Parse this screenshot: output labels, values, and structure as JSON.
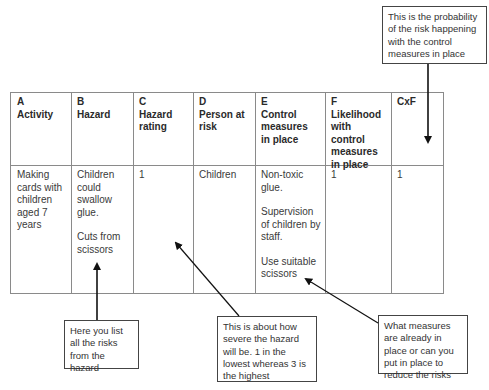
{
  "table": {
    "headers": [
      {
        "letter": "A",
        "label": "Activity"
      },
      {
        "letter": "B",
        "label": "Hazard"
      },
      {
        "letter": "C",
        "label": "Hazard rating"
      },
      {
        "letter": "D",
        "label": "Person at risk"
      },
      {
        "letter": "E",
        "label": "Control measures in place"
      },
      {
        "letter": "F",
        "label": "Likelihood with control measures in place"
      },
      {
        "letter": "",
        "label": "CxF"
      }
    ],
    "rows": [
      {
        "activity": "Making cards with children aged 7 years",
        "hazard": [
          "Children could swallow glue.",
          "Cuts from scissors"
        ],
        "hazard_rating": "1",
        "person_at_risk": "Children",
        "control_measures": [
          "Non-toxic glue.",
          "Supervision of children by staff.",
          "Use suitable scissors"
        ],
        "likelihood": "1",
        "cxf": "1"
      }
    ]
  },
  "callouts": {
    "probability": "This is the probability of the risk happening with the control measures in place",
    "risks_list": "Here you list all the risks from the hazard",
    "severity": "This is about how severe the hazard will be. 1 in the lowest whereas 3 is the highest",
    "measures": "What measures are already in place or can you put in place to reduce the risks"
  }
}
